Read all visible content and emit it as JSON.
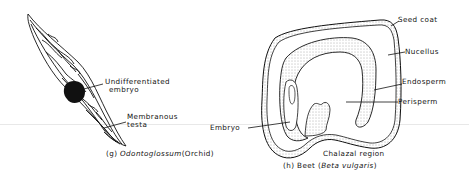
{
  "figures": [
    {
      "id": "g",
      "caption": {
        "prefix": "(g)",
        "genus": "Odontoglossum",
        "common": "(Orchid)"
      },
      "labels": [
        {
          "text_line1": "Undifferentiated",
          "text_line2": "embryo"
        },
        {
          "text_line1": "Membranous",
          "text_line2": "testa"
        }
      ]
    },
    {
      "id": "h",
      "caption": {
        "prefix": "(h)",
        "common": "Beet",
        "species_open": "(",
        "species": "Beta vulgaris",
        "species_close": ")"
      },
      "labels": [
        {
          "text": "Seed coat"
        },
        {
          "text": "Nucellus"
        },
        {
          "text": "Endosperm"
        },
        {
          "text": "Perisperm"
        },
        {
          "text": "Embryo"
        },
        {
          "text": "Chalazal region"
        }
      ]
    }
  ],
  "colors": {
    "ink": "#111111",
    "stipple": "#555555",
    "background": "#ffffff"
  }
}
